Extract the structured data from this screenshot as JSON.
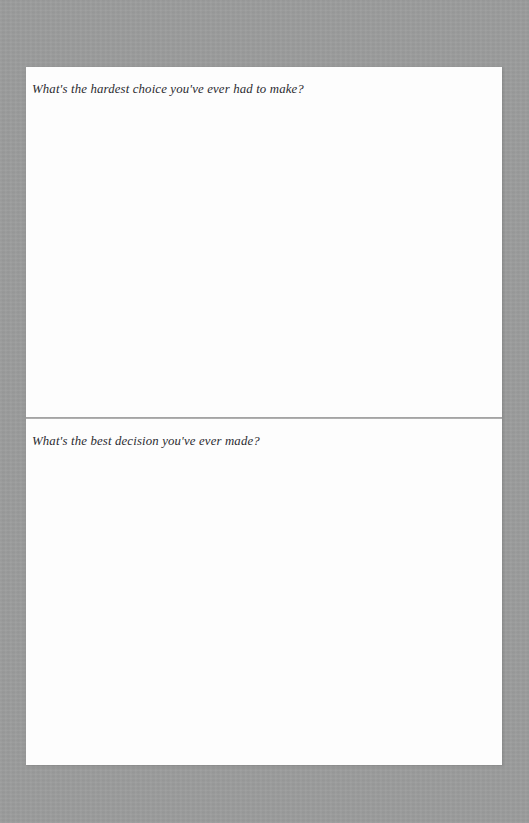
{
  "page": {
    "background_color": "#9a9b9b",
    "sheet_color": "#fdfdfd",
    "divider_color": "#8f8f8f",
    "text_color": "#2b2b30",
    "document_type": "guided-journal-page"
  },
  "panels": [
    {
      "id": "panel-hardest-choice",
      "prompt": "What's the hardest choice you've ever had to make?",
      "answer": ""
    },
    {
      "id": "panel-best-decision",
      "prompt": "What's the best decision you've ever made?",
      "answer": ""
    }
  ]
}
